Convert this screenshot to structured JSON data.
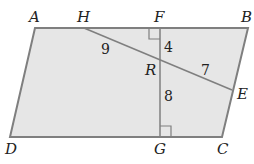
{
  "diagram": {
    "type": "geometry",
    "shape": "parallelogram",
    "colors": {
      "fill": "#e6e6e6",
      "stroke": "#7f7f7f",
      "text": "#222222"
    },
    "points": {
      "A": {
        "label": "A",
        "x": 35,
        "y": 28
      },
      "B": {
        "label": "B",
        "x": 248,
        "y": 28
      },
      "C": {
        "label": "C",
        "x": 222,
        "y": 137
      },
      "D": {
        "label": "D",
        "x": 10,
        "y": 137
      },
      "H": {
        "label": "H",
        "x": 84,
        "y": 28
      },
      "F": {
        "label": "F",
        "x": 160,
        "y": 28
      },
      "G": {
        "label": "G",
        "x": 160,
        "y": 137
      },
      "R": {
        "label": "R",
        "x": 160,
        "y": 60
      },
      "E": {
        "label": "E",
        "x": 232,
        "y": 90
      }
    },
    "segment_lengths": {
      "HR": "9",
      "FR": "4",
      "RE": "7",
      "RG": "8"
    },
    "right_angles": [
      "F",
      "G"
    ]
  }
}
